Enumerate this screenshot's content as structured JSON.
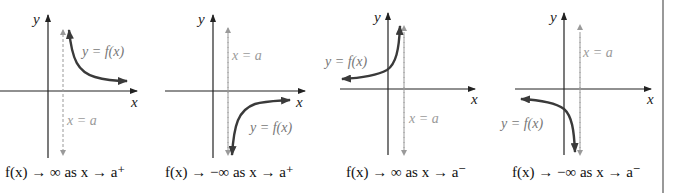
{
  "diagram": {
    "colors": {
      "axis": "#222222",
      "curve": "#3a3a3a",
      "asymptote": "#9a9a9a",
      "asymptote_label": "#9a9a9a",
      "curve_label": "#777777",
      "border": "#555555"
    },
    "panels": [
      {
        "id": "p1",
        "y_axis_label": "y",
        "x_axis_label": "x",
        "curve_label": "y = f(x)",
        "asymptote_label": "x = a",
        "caption": "f(x) → ∞ as x → a⁺"
      },
      {
        "id": "p2",
        "y_axis_label": "y",
        "x_axis_label": "x",
        "curve_label": "y = f(x)",
        "asymptote_label": "x = a",
        "caption": "f(x) → −∞ as x → a⁺"
      },
      {
        "id": "p3",
        "y_axis_label": "y",
        "x_axis_label": "x",
        "curve_label": "y = f(x)",
        "asymptote_label": "x = a",
        "caption": "f(x) → ∞ as x → a⁻"
      },
      {
        "id": "p4",
        "y_axis_label": "y",
        "x_axis_label": "x",
        "curve_label": "y = f(x)",
        "asymptote_label": "x = a",
        "caption": "f(x) → −∞ as x → a⁻"
      }
    ]
  }
}
